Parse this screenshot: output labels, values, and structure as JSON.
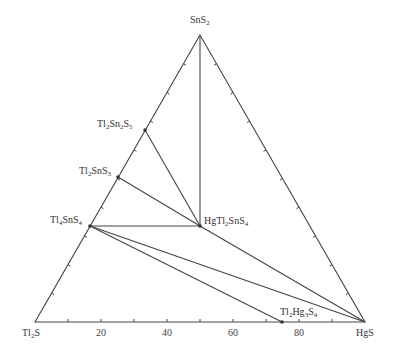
{
  "diagram": {
    "type": "ternary-phase-diagram",
    "vertices": {
      "top": {
        "formula": "SnS2",
        "base": "SnS",
        "sub": "2",
        "x": 200,
        "y": 35
      },
      "left": {
        "formula": "Tl2S",
        "base": "Tl",
        "sub": "2",
        "tail": "S",
        "x": 35,
        "y": 322
      },
      "right": {
        "formula": "HgS",
        "x": 365,
        "y": 322
      }
    },
    "compounds": [
      {
        "id": "Tl2Sn2S5",
        "parts": [
          "Tl",
          "2",
          "Sn",
          "2",
          "S",
          "5"
        ],
        "x": 145,
        "y": 130
      },
      {
        "id": "Tl2SnS3",
        "parts": [
          "Tl",
          "2",
          "SnS",
          "3"
        ],
        "x": 118,
        "y": 177
      },
      {
        "id": "Tl4SnS4",
        "parts": [
          "Tl",
          "4",
          "SnS",
          "4"
        ],
        "x": 90,
        "y": 226
      },
      {
        "id": "HgTl2SnS4",
        "parts": [
          "HgTl",
          "2",
          "SnS",
          "4"
        ],
        "x": 200,
        "y": 226
      },
      {
        "id": "Tl2Hg3S4",
        "parts": [
          "Tl",
          "2",
          "Hg",
          "3",
          "S",
          "4"
        ],
        "x": 282,
        "y": 322
      }
    ],
    "tie_lines": [
      [
        "SnS2",
        "HgTl2SnS4"
      ],
      [
        "Tl2Sn2S5",
        "HgTl2SnS4"
      ],
      [
        "Tl2SnS3",
        "HgTl2SnS4"
      ],
      [
        "Tl4SnS4",
        "HgTl2SnS4"
      ],
      [
        "HgTl2SnS4",
        "HgS"
      ],
      [
        "Tl4SnS4",
        "HgS"
      ],
      [
        "Tl4SnS4",
        "Tl2Hg3S4"
      ]
    ],
    "bottom_axis": {
      "labels": [
        "20",
        "40",
        "60",
        "80"
      ],
      "label_positions": [
        101,
        167,
        233,
        299
      ],
      "tick_step": 10
    },
    "line_color": "#444444"
  }
}
